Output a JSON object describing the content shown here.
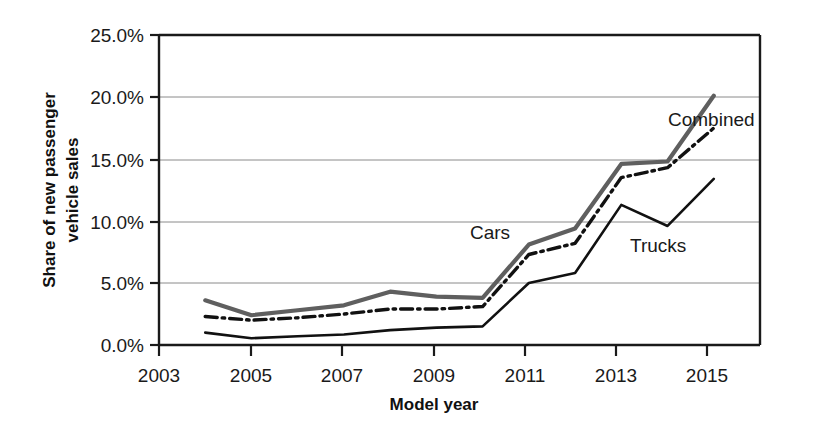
{
  "chart_data": {
    "type": "line",
    "title": "",
    "xlabel": "Model year",
    "ylabel": "Share of new passenger vehicle sales",
    "ylabel_line1": "Share of new passenger",
    "ylabel_line2": "vehicle sales",
    "x": [
      2004,
      2005,
      2006,
      2007,
      2008,
      2009,
      2010,
      2011,
      2012,
      2013,
      2014,
      2015
    ],
    "xlim": [
      2003,
      2016
    ],
    "ylim": [
      0,
      25
    ],
    "grid": true,
    "grid_axis": "y",
    "legend_position": "inline-annotations",
    "xticks": [
      2003,
      2005,
      2007,
      2009,
      2011,
      2013,
      2015
    ],
    "xtick_labels": [
      "2003",
      "2005",
      "2007",
      "2009",
      "2011",
      "2013",
      "2015"
    ],
    "yticks": [
      0,
      5,
      10,
      15,
      20,
      25
    ],
    "ytick_labels": [
      "0.0%",
      "5.0%",
      "10.0%",
      "15.0%",
      "20.0%",
      "25.0%"
    ],
    "series": [
      {
        "name": "Cars",
        "style": "solid-thick-gray",
        "color": "#5f5f5f",
        "values": [
          3.6,
          2.4,
          2.8,
          3.2,
          4.3,
          3.9,
          3.8,
          8.1,
          9.4,
          14.6,
          14.8,
          20.1
        ]
      },
      {
        "name": "Combined",
        "style": "dash-dot-black",
        "color": "#111111",
        "values": [
          2.3,
          2.0,
          2.2,
          2.5,
          2.9,
          2.9,
          3.1,
          7.3,
          8.2,
          13.5,
          14.3,
          17.5
        ]
      },
      {
        "name": "Trucks",
        "style": "solid-thin-black",
        "color": "#111111",
        "values": [
          1.0,
          0.55,
          0.7,
          0.85,
          1.2,
          1.4,
          1.5,
          5.0,
          5.8,
          11.3,
          9.6,
          13.4
        ]
      }
    ],
    "annotations": [
      {
        "text": "Combined",
        "x_px": 668,
        "y_px": 126
      },
      {
        "text": "Cars",
        "x_px": 470,
        "y_px": 239
      },
      {
        "text": "Trucks",
        "x_px": 630,
        "y_px": 252
      }
    ]
  }
}
